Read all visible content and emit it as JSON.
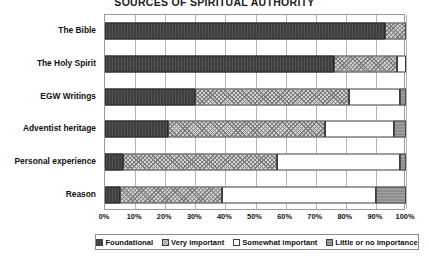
{
  "chart_data": {
    "type": "bar",
    "subtype": "stacked-horizontal-100pct",
    "title": "SOURCES OF SPIRITUAL AUTHORITY",
    "xlabel": "",
    "ylabel": "",
    "xlim": [
      0,
      100
    ],
    "grid": true,
    "legend_position": "bottom",
    "categories": [
      "The Bible",
      "The Holy Spirit",
      "EGW Writings",
      "Adventist heritage",
      "Personal experience",
      "Reason"
    ],
    "xticks": [
      "0%",
      "10%",
      "20%",
      "30%",
      "40%",
      "50%",
      "60%",
      "70%",
      "80%",
      "90%",
      "100%"
    ],
    "xtick_values": [
      0,
      10,
      20,
      30,
      40,
      50,
      60,
      70,
      80,
      90,
      100
    ],
    "series": [
      {
        "name": "Foundational",
        "key": "foundational",
        "fill_class": "fill-foundational",
        "color": "#3f3f3f",
        "values": [
          93,
          76,
          30,
          21,
          6,
          5
        ]
      },
      {
        "name": "Very important",
        "key": "very_important",
        "fill_class": "fill-very",
        "color": "#d2d2d2",
        "values": [
          7,
          21,
          51,
          52,
          51,
          34
        ]
      },
      {
        "name": "Somewhat important",
        "key": "somewhat_important",
        "fill_class": "fill-somewhat",
        "color": "#ffffff",
        "values": [
          0,
          3,
          17,
          23,
          41,
          51
        ]
      },
      {
        "name": "Little or no importance",
        "key": "little_or_none",
        "fill_class": "fill-little",
        "color": "#8e8e8e",
        "values": [
          0,
          0,
          2,
          4,
          2,
          10
        ]
      }
    ]
  }
}
